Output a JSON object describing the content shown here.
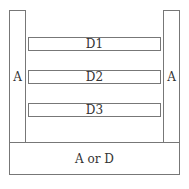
{
  "diagram": {
    "left_column": {
      "label": "A"
    },
    "right_column": {
      "label": "A"
    },
    "bars": [
      {
        "label": "D1"
      },
      {
        "label": "D2"
      },
      {
        "label": "D3"
      }
    ],
    "base": {
      "label": "A or D"
    }
  }
}
